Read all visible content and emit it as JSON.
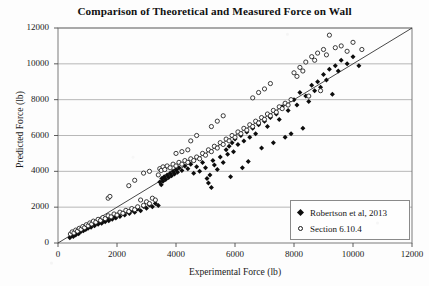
{
  "chart_data": {
    "type": "scatter",
    "title": "Comparison of Theoretical and Measured Force on Wall",
    "xlabel": "Experimental Force (lb)",
    "ylabel": "Predicted Force (lb)",
    "xlim": [
      0,
      12000
    ],
    "ylim": [
      0,
      12000
    ],
    "xticks": [
      0,
      2000,
      4000,
      6000,
      8000,
      10000,
      12000
    ],
    "yticks": [
      0,
      2000,
      4000,
      6000,
      8000,
      10000,
      12000
    ],
    "grid": "horizontal",
    "legend_position": "bottom-right",
    "reference_line": {
      "name": "1:1 line",
      "from": [
        0,
        0
      ],
      "to": [
        12000,
        12000
      ],
      "color": "#333333"
    },
    "series": [
      {
        "name": "Robertson et al, 2013",
        "marker": "filled-diamond",
        "color": "#0d0d0d",
        "points": [
          [
            400,
            300
          ],
          [
            450,
            420
          ],
          [
            520,
            360
          ],
          [
            560,
            520
          ],
          [
            600,
            450
          ],
          [
            650,
            600
          ],
          [
            700,
            520
          ],
          [
            720,
            700
          ],
          [
            780,
            640
          ],
          [
            820,
            760
          ],
          [
            860,
            680
          ],
          [
            900,
            840
          ],
          [
            940,
            760
          ],
          [
            980,
            900
          ],
          [
            1020,
            820
          ],
          [
            1080,
            960
          ],
          [
            1120,
            880
          ],
          [
            1180,
            1040
          ],
          [
            1240,
            960
          ],
          [
            1300,
            1120
          ],
          [
            1360,
            1040
          ],
          [
            1420,
            1200
          ],
          [
            1480,
            1100
          ],
          [
            1540,
            1260
          ],
          [
            1600,
            1180
          ],
          [
            1660,
            1340
          ],
          [
            1720,
            1240
          ],
          [
            1780,
            1420
          ],
          [
            1840,
            1320
          ],
          [
            1900,
            1500
          ],
          [
            1960,
            1400
          ],
          [
            2020,
            1580
          ],
          [
            2100,
            1480
          ],
          [
            2180,
            1660
          ],
          [
            2260,
            1560
          ],
          [
            2340,
            1740
          ],
          [
            2420,
            1640
          ],
          [
            2500,
            1820
          ],
          [
            2600,
            1720
          ],
          [
            2700,
            1900
          ],
          [
            2800,
            1800
          ],
          [
            2900,
            2040
          ],
          [
            3000,
            1940
          ],
          [
            3100,
            2120
          ],
          [
            3200,
            2020
          ],
          [
            3300,
            2200
          ],
          [
            3400,
            2100
          ],
          [
            3450,
            3400
          ],
          [
            3500,
            3250
          ],
          [
            3520,
            3600
          ],
          [
            3560,
            3450
          ],
          [
            3600,
            3700
          ],
          [
            3650,
            3550
          ],
          [
            3700,
            3800
          ],
          [
            3750,
            3650
          ],
          [
            3800,
            3900
          ],
          [
            3850,
            3750
          ],
          [
            3900,
            4000
          ],
          [
            3950,
            3850
          ],
          [
            4000,
            4100
          ],
          [
            4050,
            3950
          ],
          [
            4100,
            4200
          ],
          [
            4200,
            4050
          ],
          [
            4300,
            4300
          ],
          [
            4400,
            4150
          ],
          [
            4500,
            4400
          ],
          [
            4600,
            3900
          ],
          [
            4700,
            4250
          ],
          [
            4800,
            4000
          ],
          [
            4900,
            4500
          ],
          [
            5000,
            4200
          ],
          [
            5050,
            3600
          ],
          [
            5100,
            3350
          ],
          [
            5150,
            3800
          ],
          [
            5200,
            3100
          ],
          [
            5250,
            4600
          ],
          [
            5300,
            4350
          ],
          [
            5400,
            4100
          ],
          [
            5500,
            4800
          ],
          [
            5600,
            4500
          ],
          [
            5700,
            5200
          ],
          [
            5750,
            4950
          ],
          [
            5800,
            5400
          ],
          [
            5850,
            3700
          ],
          [
            5900,
            5600
          ],
          [
            5950,
            5100
          ],
          [
            6000,
            5800
          ],
          [
            6100,
            5500
          ],
          [
            6200,
            6000
          ],
          [
            6250,
            4200
          ],
          [
            6300,
            5700
          ],
          [
            6400,
            6200
          ],
          [
            6450,
            4550
          ],
          [
            6500,
            5900
          ],
          [
            6600,
            6400
          ],
          [
            6700,
            6100
          ],
          [
            6800,
            6600
          ],
          [
            6900,
            5300
          ],
          [
            7000,
            6800
          ],
          [
            7100,
            6500
          ],
          [
            7200,
            7000
          ],
          [
            7300,
            5600
          ],
          [
            7400,
            7200
          ],
          [
            7500,
            6900
          ],
          [
            7600,
            7600
          ],
          [
            7700,
            5900
          ],
          [
            7800,
            7400
          ],
          [
            7900,
            6100
          ],
          [
            8000,
            8000
          ],
          [
            8100,
            7700
          ],
          [
            8200,
            8400
          ],
          [
            8300,
            6400
          ],
          [
            8400,
            8200
          ],
          [
            8500,
            7900
          ],
          [
            8600,
            8800
          ],
          [
            8700,
            8500
          ],
          [
            8800,
            9000
          ],
          [
            8900,
            8700
          ],
          [
            9000,
            9400
          ],
          [
            9100,
            9100
          ],
          [
            9200,
            9700
          ],
          [
            9300,
            8300
          ],
          [
            9400,
            9900
          ],
          [
            9500,
            9600
          ],
          [
            9600,
            10200
          ],
          [
            9800,
            10000
          ],
          [
            10000,
            10400
          ],
          [
            10200,
            9900
          ]
        ]
      },
      {
        "name": "Section 6.10.4",
        "marker": "open-circle",
        "color": "#1a1a1a",
        "points": [
          [
            420,
            500
          ],
          [
            480,
            620
          ],
          [
            540,
            560
          ],
          [
            600,
            720
          ],
          [
            660,
            660
          ],
          [
            720,
            820
          ],
          [
            780,
            760
          ],
          [
            840,
            920
          ],
          [
            900,
            860
          ],
          [
            960,
            1020
          ],
          [
            1020,
            960
          ],
          [
            1080,
            1120
          ],
          [
            1140,
            1060
          ],
          [
            1200,
            1220
          ],
          [
            1280,
            1160
          ],
          [
            1360,
            1320
          ],
          [
            1440,
            1260
          ],
          [
            1520,
            1420
          ],
          [
            1600,
            1360
          ],
          [
            1700,
            1520
          ],
          [
            1800,
            1460
          ],
          [
            1700,
            2500
          ],
          [
            1760,
            2600
          ],
          [
            1900,
            1620
          ],
          [
            2000,
            1560
          ],
          [
            2100,
            1720
          ],
          [
            2200,
            1660
          ],
          [
            2300,
            1820
          ],
          [
            2400,
            1760
          ],
          [
            2500,
            1920
          ],
          [
            2600,
            1860
          ],
          [
            2700,
            2020
          ],
          [
            2800,
            2400
          ],
          [
            2900,
            2100
          ],
          [
            3000,
            2300
          ],
          [
            3100,
            2200
          ],
          [
            3200,
            2500
          ],
          [
            3300,
            2400
          ],
          [
            3400,
            3800
          ],
          [
            3450,
            4150
          ],
          [
            3500,
            4050
          ],
          [
            3560,
            4250
          ],
          [
            3620,
            4100
          ],
          [
            3700,
            4300
          ],
          [
            3800,
            4200
          ],
          [
            3900,
            4400
          ],
          [
            4000,
            4300
          ],
          [
            4100,
            4500
          ],
          [
            4200,
            4400
          ],
          [
            4300,
            4600
          ],
          [
            4400,
            4500
          ],
          [
            4500,
            4700
          ],
          [
            4600,
            4600
          ],
          [
            4700,
            4800
          ],
          [
            4800,
            4700
          ],
          [
            4000,
            5000
          ],
          [
            4200,
            5100
          ],
          [
            4400,
            5200
          ],
          [
            4900,
            5000
          ],
          [
            5000,
            4900
          ],
          [
            5100,
            5200
          ],
          [
            5200,
            5100
          ],
          [
            5300,
            5400
          ],
          [
            5400,
            5300
          ],
          [
            5500,
            5600
          ],
          [
            5600,
            5500
          ],
          [
            5700,
            5800
          ],
          [
            5800,
            5700
          ],
          [
            5900,
            6000
          ],
          [
            6000,
            5900
          ],
          [
            6100,
            6200
          ],
          [
            6200,
            6100
          ],
          [
            6300,
            6400
          ],
          [
            6400,
            6300
          ],
          [
            6500,
            6600
          ],
          [
            6600,
            6500
          ],
          [
            6700,
            6800
          ],
          [
            6800,
            6700
          ],
          [
            6900,
            7000
          ],
          [
            7000,
            6900
          ],
          [
            7100,
            7200
          ],
          [
            7200,
            7100
          ],
          [
            7300,
            7400
          ],
          [
            7400,
            7300
          ],
          [
            7500,
            7600
          ],
          [
            7600,
            7500
          ],
          [
            7700,
            7800
          ],
          [
            7800,
            7700
          ],
          [
            7900,
            8000
          ],
          [
            8000,
            9500
          ],
          [
            8100,
            9300
          ],
          [
            8200,
            9800
          ],
          [
            8300,
            9600
          ],
          [
            8400,
            10100
          ],
          [
            8500,
            8200
          ],
          [
            8600,
            10400
          ],
          [
            8700,
            10200
          ],
          [
            8800,
            10600
          ],
          [
            8900,
            8500
          ],
          [
            9000,
            10800
          ],
          [
            9100,
            10500
          ],
          [
            9200,
            11600
          ],
          [
            9400,
            10900
          ],
          [
            9600,
            11000
          ],
          [
            9800,
            10700
          ],
          [
            10000,
            11200
          ],
          [
            10300,
            10800
          ],
          [
            7000,
            8600
          ],
          [
            7200,
            8900
          ],
          [
            6800,
            8400
          ],
          [
            6600,
            8100
          ],
          [
            5600,
            7100
          ],
          [
            5400,
            6800
          ],
          [
            5200,
            6500
          ],
          [
            4700,
            6000
          ],
          [
            4500,
            5700
          ],
          [
            2900,
            3900
          ],
          [
            3100,
            4000
          ],
          [
            2600,
            3500
          ],
          [
            2400,
            3200
          ]
        ]
      }
    ]
  }
}
